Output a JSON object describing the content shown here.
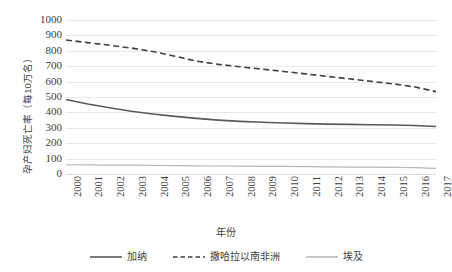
{
  "chart_data": {
    "type": "line",
    "title": "",
    "subtitle": "",
    "xlabel": "年份",
    "ylabel": "孕产妇死亡率（每10万名）",
    "x": [
      2000,
      2001,
      2002,
      2003,
      2004,
      2005,
      2006,
      2007,
      2008,
      2009,
      2010,
      2011,
      2012,
      2013,
      2014,
      2015,
      2016,
      2017
    ],
    "categories": [
      "2000",
      "2001",
      "2002",
      "2003",
      "2004",
      "2005",
      "2006",
      "2007",
      "2008",
      "2009",
      "2010",
      "2011",
      "2012",
      "2013",
      "2014",
      "2015",
      "2016",
      "2017"
    ],
    "xlim": [
      2000,
      2017
    ],
    "ylim": [
      0,
      1000
    ],
    "yticks": [
      1000,
      900,
      800,
      700,
      600,
      500,
      400,
      300,
      200,
      100,
      0
    ],
    "grid": "horizontal",
    "legend_position": "bottom",
    "series": [
      {
        "name": "加纳",
        "style": "solid",
        "color": "#595959",
        "width": 1.6,
        "values": [
          484,
          455,
          430,
          408,
          390,
          374,
          361,
          350,
          342,
          336,
          331,
          327,
          324,
          322,
          320,
          318,
          315,
          308
        ]
      },
      {
        "name": "撒哈拉以南非洲",
        "style": "dashed",
        "color": "#404040",
        "width": 1.6,
        "values": [
          870,
          853,
          836,
          818,
          795,
          765,
          733,
          712,
          696,
          681,
          666,
          650,
          634,
          618,
          602,
          586,
          566,
          535
        ]
      },
      {
        "name": "埃及",
        "style": "solid",
        "color": "#b8b8b8",
        "width": 1.2,
        "values": [
          60,
          59,
          58,
          57,
          56,
          55,
          53,
          52,
          51,
          50,
          49,
          48,
          46,
          45,
          44,
          43,
          42,
          37
        ]
      }
    ]
  },
  "colors": {
    "background": "#ffffff",
    "gridline": "#e8e8e8",
    "axis": "#d9d9d9",
    "text": "#3d3d3d",
    "series_ghana": "#595959",
    "series_ssa": "#404040",
    "series_egypt": "#b8b8b8"
  },
  "legend": {
    "items": [
      {
        "label": "加纳",
        "style": "solid",
        "color": "#595959"
      },
      {
        "label": "撒哈拉以南非洲",
        "style": "dashed",
        "color": "#404040"
      },
      {
        "label": "埃及",
        "style": "solid",
        "color": "#b8b8b8"
      }
    ]
  }
}
